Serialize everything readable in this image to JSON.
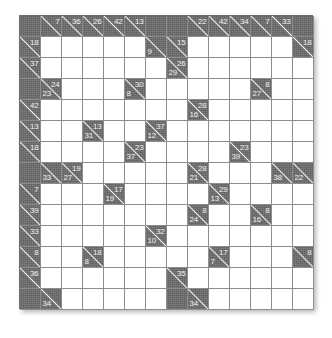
{
  "puzzle": {
    "type": "kakuro",
    "rows": 14,
    "cols": 14,
    "cell_size_px": 21,
    "colors": {
      "block": "#6d6d6d",
      "open": "#ffffff",
      "grid_line": "#8d8d8d",
      "clue_text": "#f2f2f2",
      "border": "#6e6e6e"
    },
    "legend": {
      "down_label": "down clue (upper-right of diagonal)",
      "across_label": "across clue (lower-left of diagonal)"
    },
    "clues": [
      {
        "r": 0,
        "c": 1,
        "down": "7"
      },
      {
        "r": 0,
        "c": 2,
        "down": "36"
      },
      {
        "r": 0,
        "c": 3,
        "down": "26"
      },
      {
        "r": 0,
        "c": 4,
        "down": "42"
      },
      {
        "r": 0,
        "c": 5,
        "down": "13"
      },
      {
        "r": 0,
        "c": 8,
        "down": "22"
      },
      {
        "r": 0,
        "c": 9,
        "down": "42"
      },
      {
        "r": 0,
        "c": 10,
        "down": "34"
      },
      {
        "r": 0,
        "c": 11,
        "down": "7"
      },
      {
        "r": 0,
        "c": 12,
        "down": "33"
      },
      {
        "r": 1,
        "c": 0,
        "down": "18"
      },
      {
        "r": 1,
        "c": 6,
        "across": "9"
      },
      {
        "r": 1,
        "c": 7,
        "down": "15"
      },
      {
        "r": 1,
        "c": 13,
        "down": "18"
      },
      {
        "r": 2,
        "c": 0,
        "down": "37"
      },
      {
        "r": 2,
        "c": 7,
        "down": "26",
        "across": "29"
      },
      {
        "r": 3,
        "c": 1,
        "down": "24",
        "across": "23"
      },
      {
        "r": 3,
        "c": 5,
        "down": "30",
        "across": "8"
      },
      {
        "r": 3,
        "c": 11,
        "down": "8",
        "across": "27"
      },
      {
        "r": 4,
        "c": 0,
        "down": "42"
      },
      {
        "r": 4,
        "c": 8,
        "down": "28",
        "across": "16"
      },
      {
        "r": 5,
        "c": 0,
        "down": "13"
      },
      {
        "r": 5,
        "c": 3,
        "down": "13",
        "across": "31"
      },
      {
        "r": 5,
        "c": 6,
        "down": "37",
        "across": "12"
      },
      {
        "r": 6,
        "c": 0,
        "down": "18"
      },
      {
        "r": 6,
        "c": 5,
        "down": "23",
        "across": "37"
      },
      {
        "r": 6,
        "c": 10,
        "down": "23",
        "across": "39"
      },
      {
        "r": 7,
        "c": 1,
        "across": "33"
      },
      {
        "r": 7,
        "c": 2,
        "down": "19",
        "across": "27"
      },
      {
        "r": 7,
        "c": 8,
        "down": "28",
        "across": "21"
      },
      {
        "r": 7,
        "c": 12,
        "across": "38"
      },
      {
        "r": 7,
        "c": 13,
        "across": "22"
      },
      {
        "r": 8,
        "c": 0,
        "down": "7"
      },
      {
        "r": 8,
        "c": 4,
        "down": "17",
        "across": "19"
      },
      {
        "r": 8,
        "c": 9,
        "down": "29",
        "across": "13"
      },
      {
        "r": 9,
        "c": 0,
        "down": "39"
      },
      {
        "r": 9,
        "c": 8,
        "down": "8",
        "across": "24"
      },
      {
        "r": 9,
        "c": 11,
        "down": "8",
        "across": "16"
      },
      {
        "r": 10,
        "c": 0,
        "down": "33"
      },
      {
        "r": 10,
        "c": 6,
        "down": "32",
        "across": "10"
      },
      {
        "r": 11,
        "c": 0,
        "down": "8"
      },
      {
        "r": 11,
        "c": 3,
        "down": "18",
        "across": "8"
      },
      {
        "r": 11,
        "c": 9,
        "down": "17",
        "across": "7"
      },
      {
        "r": 11,
        "c": 13,
        "down": "8"
      },
      {
        "r": 12,
        "c": 0,
        "down": "36"
      },
      {
        "r": 12,
        "c": 7,
        "down": "35"
      },
      {
        "r": 13,
        "c": 1,
        "across": "34"
      },
      {
        "r": 13,
        "c": 8,
        "across": "34"
      }
    ],
    "plain_blocks": [
      {
        "r": 0,
        "c": 0
      },
      {
        "r": 0,
        "c": 6
      },
      {
        "r": 0,
        "c": 7
      },
      {
        "r": 0,
        "c": 13
      },
      {
        "r": 1,
        "c": 7
      },
      {
        "r": 3,
        "c": 0
      },
      {
        "r": 7,
        "c": 0
      },
      {
        "r": 13,
        "c": 0
      },
      {
        "r": 13,
        "c": 7
      }
    ]
  }
}
